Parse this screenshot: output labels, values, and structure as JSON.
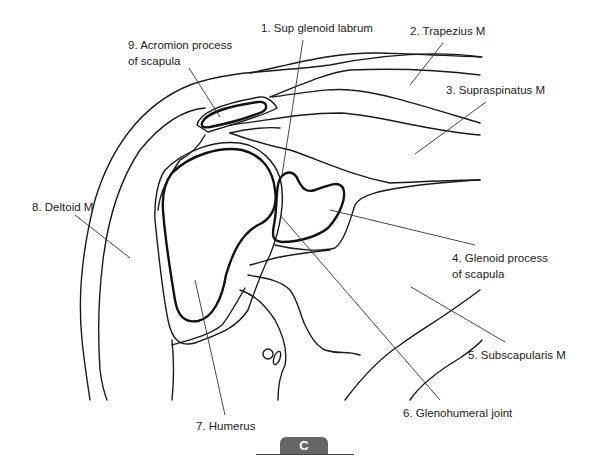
{
  "figure": {
    "panel_label": "C",
    "labels": [
      {
        "id": "1",
        "line1": "1. Sup glenoid labrum"
      },
      {
        "id": "2",
        "line1": "2. Trapezius M"
      },
      {
        "id": "3",
        "line1": "3. Supraspinatus M"
      },
      {
        "id": "4",
        "line1": "4. Glenoid process",
        "line2": "of scapula"
      },
      {
        "id": "5",
        "line1": "5. Subscapularis M"
      },
      {
        "id": "6",
        "line1": "6. Glenohumeral joint"
      },
      {
        "id": "7",
        "line1": "7. Humerus"
      },
      {
        "id": "8",
        "line1": "8. Deltoid M"
      },
      {
        "id": "9",
        "line1": "9. Acromion process",
        "line2": "of scapula"
      }
    ]
  }
}
